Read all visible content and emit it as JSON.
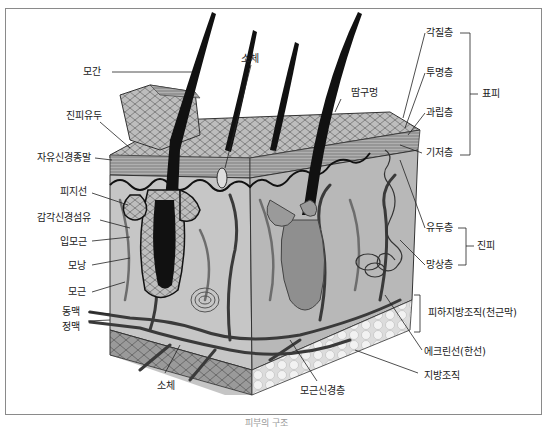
{
  "figure": {
    "caption": "피부의 구조",
    "labels_left": [
      {
        "id": "hair-shaft",
        "text": "모간"
      },
      {
        "id": "dermal-papilla",
        "text": "진피유두"
      },
      {
        "id": "free-nerve-ending",
        "text": "자유신경종말"
      },
      {
        "id": "sebaceous-gland",
        "text": "피지선"
      },
      {
        "id": "sensory-nerve-fiber",
        "text": "감각신경섬유"
      },
      {
        "id": "arrector-pili",
        "text": "입모근"
      },
      {
        "id": "hair-follicle",
        "text": "모낭"
      },
      {
        "id": "hair-root",
        "text": "모근"
      },
      {
        "id": "artery",
        "text": "동맥"
      },
      {
        "id": "vein",
        "text": "정맥"
      }
    ],
    "labels_top": [
      {
        "id": "corpuscle-top",
        "text": "소체"
      },
      {
        "id": "sweat-pore",
        "text": "땀구멍"
      }
    ],
    "labels_bottom": [
      {
        "id": "corpuscle-bottom",
        "text": "소체"
      },
      {
        "id": "hair-root-nerve-plexus",
        "text": "모근신경층"
      }
    ],
    "labels_right": [
      {
        "id": "stratum-corneum",
        "text": "각질층"
      },
      {
        "id": "stratum-lucidum",
        "text": "투명층"
      },
      {
        "id": "stratum-granulosum",
        "text": "과립층"
      },
      {
        "id": "stratum-basale",
        "text": "기저층"
      },
      {
        "id": "papillary-layer",
        "text": "유두층"
      },
      {
        "id": "reticular-layer",
        "text": "망상층"
      },
      {
        "id": "eccrine-gland",
        "text": "에크린선(한선)"
      },
      {
        "id": "adipose-tissue",
        "text": "지방조직"
      }
    ],
    "groups": [
      {
        "id": "epidermis",
        "text": "표피"
      },
      {
        "id": "dermis",
        "text": "진피"
      },
      {
        "id": "subcutis",
        "text": "피하지방조직(천근막)"
      }
    ],
    "colors": {
      "frame": "#8a8a8a",
      "tissue_light": "#c8c8c8",
      "tissue_mid": "#a9a9a9",
      "tissue_dark": "#7c7c7c",
      "hair": "#111111",
      "vessel": "#3a3a3a",
      "fat": "#e9e9e9"
    }
  }
}
